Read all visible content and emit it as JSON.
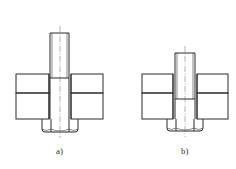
{
  "figure": {
    "colors": {
      "line": "#2a2a2a",
      "hatch": "#3a3a3a",
      "background": "#ffffff"
    },
    "panels": [
      {
        "id": "a",
        "label": "a)",
        "bolt": {
          "x_left": 50,
          "x_right": 69,
          "top": 33,
          "thread_end_y": 78
        },
        "plates": {
          "x_left": 16,
          "x_right": 103,
          "top": 74,
          "joint_y": 93,
          "bottom": 119
        },
        "hole": {
          "x_left": 49,
          "x_right": 71
        },
        "nut": {
          "x_left": 42,
          "x_right": 78,
          "top": 119,
          "bottom": 132
        },
        "centerline_x": 60
      },
      {
        "id": "b",
        "label": "b)",
        "bolt": {
          "x_left": 175,
          "x_right": 195,
          "top": 53,
          "thread_end_y": 99
        },
        "plates": {
          "x_left": 142,
          "x_right": 228,
          "top": 74,
          "joint_y": 93,
          "bottom": 119
        },
        "hole": {
          "x_left": 173,
          "x_right": 197
        },
        "nut": {
          "x_left": 167,
          "x_right": 203,
          "top": 119,
          "bottom": 131
        },
        "centerline_x": 185
      }
    ]
  }
}
